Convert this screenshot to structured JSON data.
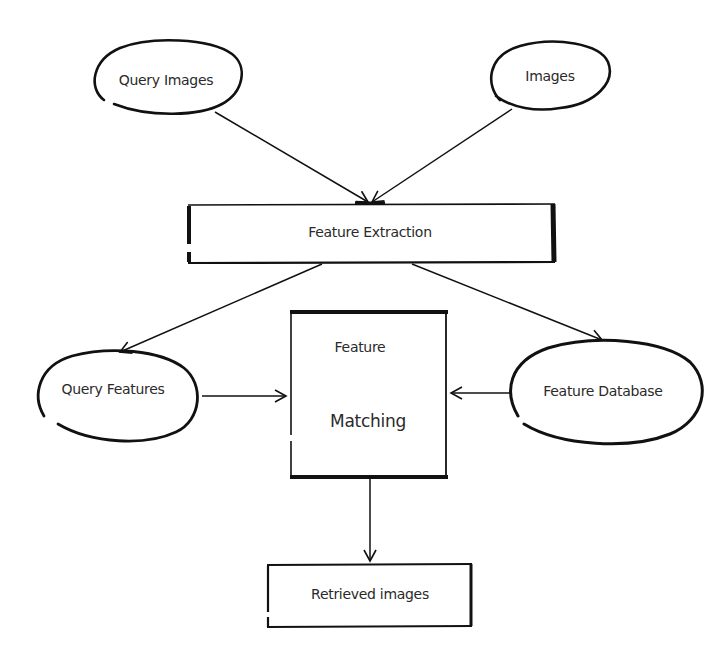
{
  "diagram": {
    "nodes": {
      "query_images": {
        "label": "Query Images",
        "shape": "ellipse"
      },
      "images": {
        "label": "Images",
        "shape": "ellipse"
      },
      "feature_extraction": {
        "label": "Feature Extraction",
        "shape": "rectangle"
      },
      "query_features": {
        "label": "Query Features",
        "shape": "ellipse"
      },
      "feature_matching": {
        "label_top": "Feature",
        "label_bottom": "Matching",
        "shape": "rectangle"
      },
      "feature_database": {
        "label": "Feature Database",
        "shape": "ellipse"
      },
      "retrieved_images": {
        "label": "Retrieved images",
        "shape": "rectangle"
      }
    },
    "edges": [
      {
        "from": "Query Images",
        "to": "Feature Extraction"
      },
      {
        "from": "Images",
        "to": "Feature Extraction"
      },
      {
        "from": "Feature Extraction",
        "to": "Query Features"
      },
      {
        "from": "Feature Extraction",
        "to": "Feature Database"
      },
      {
        "from": "Query Features",
        "to": "Feature Matching"
      },
      {
        "from": "Feature Database",
        "to": "Feature Matching"
      },
      {
        "from": "Feature Matching",
        "to": "Retrieved images"
      }
    ],
    "stroke_color": "#111111"
  }
}
